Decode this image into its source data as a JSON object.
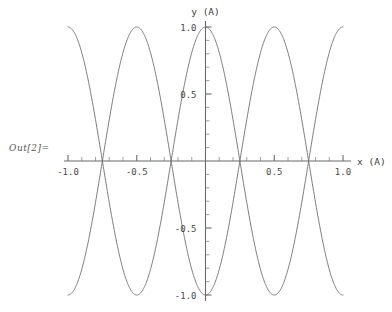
{
  "cell": {
    "out_label": "Out[2]="
  },
  "chart_data": {
    "type": "line",
    "title": "",
    "subtitle": "",
    "xlabel": "x (A)",
    "ylabel": "y (A)",
    "xlim": [
      -1.0,
      1.0
    ],
    "ylim": [
      -1.0,
      1.0
    ],
    "grid": false,
    "legend": false,
    "legend_position": "none",
    "axes_style": "crossing-at-origin",
    "x_major_ticks": [
      -1.0,
      -0.5,
      0.5,
      1.0
    ],
    "x_major_tick_labels": [
      "-1.0",
      "-0.5",
      "0.5",
      "1.0"
    ],
    "y_major_ticks": [
      -1.0,
      -0.5,
      0.5,
      1.0
    ],
    "y_major_tick_labels": [
      "-1.0",
      "-0.5",
      "0.5",
      "1.0"
    ],
    "x_minor_tick_step": 0.1,
    "y_minor_tick_step": 0.1,
    "line_color": "#6e6e6e",
    "background_color": "#ffffff",
    "annotations": [],
    "series": [
      {
        "name": "y = cos(2 pi x)",
        "amplitude": 1.0,
        "wavelength": 1.0,
        "phase": 0.0,
        "x": [
          -1.0,
          -0.95,
          -0.9,
          -0.85,
          -0.8,
          -0.75,
          -0.7,
          -0.65,
          -0.6,
          -0.55,
          -0.5,
          -0.45,
          -0.4,
          -0.35,
          -0.3,
          -0.25,
          -0.2,
          -0.15,
          -0.1,
          -0.05,
          0.0,
          0.05,
          0.1,
          0.15,
          0.2,
          0.25,
          0.3,
          0.35,
          0.4,
          0.45,
          0.5,
          0.55,
          0.6,
          0.65,
          0.7,
          0.75,
          0.8,
          0.85,
          0.9,
          0.95,
          1.0
        ],
        "values": [
          1.0,
          0.951,
          0.809,
          0.588,
          0.309,
          0.0,
          -0.309,
          -0.588,
          -0.809,
          -0.951,
          -1.0,
          -0.951,
          -0.809,
          -0.588,
          -0.309,
          0.0,
          0.309,
          0.588,
          0.809,
          0.951,
          1.0,
          0.951,
          0.809,
          0.588,
          0.309,
          0.0,
          -0.309,
          -0.588,
          -0.809,
          -0.951,
          -1.0,
          -0.951,
          -0.809,
          -0.588,
          -0.309,
          0.0,
          0.309,
          0.588,
          0.809,
          0.951,
          1.0
        ]
      },
      {
        "name": "y = -cos(2 pi x)",
        "amplitude": 1.0,
        "wavelength": 1.0,
        "phase": 3.14159,
        "x": [
          -1.0,
          -0.95,
          -0.9,
          -0.85,
          -0.8,
          -0.75,
          -0.7,
          -0.65,
          -0.6,
          -0.55,
          -0.5,
          -0.45,
          -0.4,
          -0.35,
          -0.3,
          -0.25,
          -0.2,
          -0.15,
          -0.1,
          -0.05,
          0.0,
          0.05,
          0.1,
          0.15,
          0.2,
          0.25,
          0.3,
          0.35,
          0.4,
          0.45,
          0.5,
          0.55,
          0.6,
          0.65,
          0.7,
          0.75,
          0.8,
          0.85,
          0.9,
          0.95,
          1.0
        ],
        "values": [
          -1.0,
          -0.951,
          -0.809,
          -0.588,
          -0.309,
          0.0,
          0.309,
          0.588,
          0.809,
          0.951,
          1.0,
          0.951,
          0.809,
          0.588,
          0.309,
          0.0,
          -0.309,
          -0.588,
          -0.809,
          -0.951,
          -1.0,
          -0.951,
          -0.809,
          -0.588,
          -0.309,
          0.0,
          0.309,
          0.588,
          0.809,
          0.951,
          1.0,
          0.951,
          0.809,
          0.588,
          0.309,
          0.0,
          -0.309,
          -0.588,
          -0.809,
          -0.951,
          -1.0
        ]
      }
    ]
  }
}
